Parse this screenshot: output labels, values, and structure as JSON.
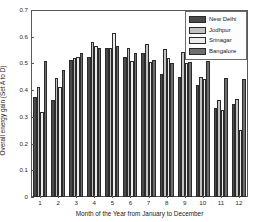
{
  "chart_data": {
    "type": "bar",
    "title": "",
    "xlabel": "Month of the Year from January to December",
    "ylabel": "Overall energy gain (Set A to D)",
    "categories": [
      "1",
      "2",
      "3",
      "4",
      "5",
      "6",
      "7",
      "8",
      "9",
      "10",
      "11",
      "12"
    ],
    "ylim": [
      0,
      0.7
    ],
    "yticks": [
      "0",
      "0.1",
      "0.2",
      "0.3",
      "0.4",
      "0.5",
      "0.6",
      "0.7"
    ],
    "ytick_values": [
      0,
      0.1,
      0.2,
      0.3,
      0.4,
      0.5,
      0.6,
      0.7
    ],
    "grid": false,
    "legend_position": "top-right",
    "series": [
      {
        "name": "New Delhi",
        "color": "#4a4a4a",
        "values": [
          0.375,
          0.362,
          0.513,
          0.524,
          0.557,
          0.525,
          0.538,
          0.462,
          0.45,
          0.418,
          0.335,
          0.347
        ]
      },
      {
        "name": "Jodhpur",
        "color": "#c2c2c2",
        "values": [
          0.41,
          0.447,
          0.519,
          0.581,
          0.559,
          0.558,
          0.573,
          0.554,
          0.541,
          0.448,
          0.364,
          0.366
        ]
      },
      {
        "name": "Srinagar",
        "color": "#ededed",
        "values": [
          0.32,
          0.413,
          0.524,
          0.564,
          0.615,
          0.508,
          0.505,
          0.521,
          0.5,
          0.443,
          0.325,
          0.252
        ]
      },
      {
        "name": "Bangalore",
        "color": "#6e6e6e",
        "values": [
          0.51,
          0.476,
          0.539,
          0.556,
          0.566,
          0.538,
          0.514,
          0.5,
          0.507,
          0.51,
          0.446,
          0.441
        ]
      }
    ]
  },
  "legend": {
    "items": [
      {
        "label": "New Delhi",
        "color": "#4a4a4a"
      },
      {
        "label": "Jodhpur",
        "color": "#c2c2c2"
      },
      {
        "label": "Srinagar",
        "color": "#ededed"
      },
      {
        "label": "Bangalore",
        "color": "#6e6e6e"
      }
    ]
  }
}
